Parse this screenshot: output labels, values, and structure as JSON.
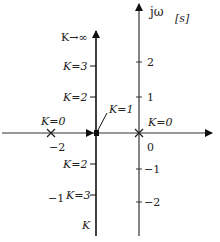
{
  "diagram": {
    "type": "root-locus",
    "plane_label": "[s]",
    "imag_axis_label": "jω",
    "real_axis_ticks": [
      {
        "value": "-2",
        "label": "−2"
      },
      {
        "value": "0",
        "label": "0"
      }
    ],
    "imag_axis_ticks": [
      {
        "value": "2",
        "label": "2"
      },
      {
        "value": "1",
        "label": "1"
      },
      {
        "value": "-1",
        "label": "−1"
      },
      {
        "value": "-2",
        "label": "−2"
      }
    ],
    "poles": [
      {
        "location": "-2",
        "label": "K=0"
      },
      {
        "location": "0",
        "label": "K=0"
      }
    ],
    "breakaway": {
      "location": "-1",
      "label": "K=1"
    },
    "locus_branch_labels": {
      "upper_end": "K→∞",
      "upper_k3": "K=3",
      "upper_k2": "K=2",
      "lower_k2": "K=2",
      "lower_k3": "K=3",
      "lower_end": "K",
      "branch_real_part": "−1"
    },
    "colors": {
      "axis": "#222222",
      "locus": "#111111",
      "background": "#ffffff"
    }
  }
}
